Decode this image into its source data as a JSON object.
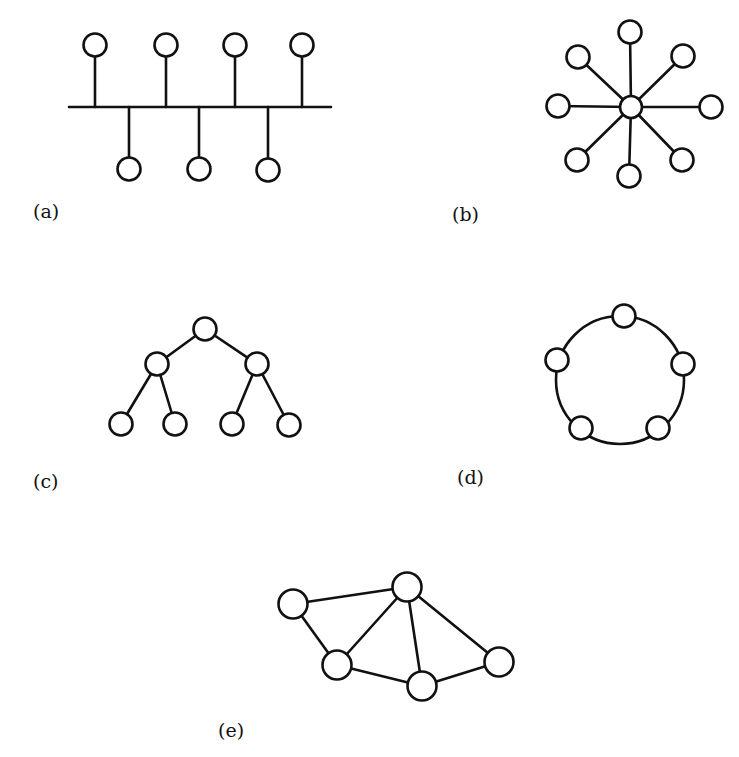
{
  "figure": {
    "panels": [
      {
        "id": "a",
        "label": "(a)",
        "topology": "bus",
        "label_pos": [
          33,
          218
        ],
        "bus": {
          "x1": 69,
          "x2": 331,
          "y": 107
        },
        "node_radius": 11.5,
        "nodes": [
          {
            "x": 95,
            "y": 45,
            "side": "top"
          },
          {
            "x": 166,
            "y": 45,
            "side": "top"
          },
          {
            "x": 235,
            "y": 45,
            "side": "top"
          },
          {
            "x": 302,
            "y": 45,
            "side": "top"
          },
          {
            "x": 129,
            "y": 169,
            "side": "bottom"
          },
          {
            "x": 199,
            "y": 169,
            "side": "bottom"
          },
          {
            "x": 268,
            "y": 170,
            "side": "bottom"
          }
        ]
      },
      {
        "id": "b",
        "label": "(b)",
        "topology": "star",
        "label_pos": [
          452,
          221
        ],
        "hub": {
          "x": 631,
          "y": 107,
          "r": 11
        },
        "node_radius": 11.5,
        "nodes": [
          {
            "x": 630,
            "y": 32
          },
          {
            "x": 683,
            "y": 56
          },
          {
            "x": 711,
            "y": 107
          },
          {
            "x": 682,
            "y": 160
          },
          {
            "x": 629,
            "y": 176
          },
          {
            "x": 577,
            "y": 160
          },
          {
            "x": 558,
            "y": 106
          },
          {
            "x": 578,
            "y": 57
          }
        ]
      },
      {
        "id": "c",
        "label": "(c)",
        "topology": "tree",
        "label_pos": [
          33,
          488
        ],
        "node_radius": 11.5,
        "nodes": [
          {
            "x": 205,
            "y": 329
          },
          {
            "x": 157,
            "y": 364
          },
          {
            "x": 257,
            "y": 364
          },
          {
            "x": 121,
            "y": 424
          },
          {
            "x": 175,
            "y": 424
          },
          {
            "x": 232,
            "y": 424
          },
          {
            "x": 289,
            "y": 425
          }
        ],
        "edges": [
          [
            0,
            1
          ],
          [
            0,
            2
          ],
          [
            1,
            3
          ],
          [
            1,
            4
          ],
          [
            2,
            5
          ],
          [
            2,
            6
          ]
        ]
      },
      {
        "id": "d",
        "label": "(d)",
        "topology": "ring",
        "label_pos": [
          457,
          484
        ],
        "ring": {
          "cx": 620,
          "cy": 380,
          "r": 64
        },
        "node_radius": 11.5,
        "nodes": [
          {
            "x": 624,
            "y": 316
          },
          {
            "x": 683,
            "y": 364
          },
          {
            "x": 658,
            "y": 428
          },
          {
            "x": 581,
            "y": 428
          },
          {
            "x": 557,
            "y": 360
          }
        ]
      },
      {
        "id": "e",
        "label": "(e)",
        "topology": "mesh",
        "label_pos": [
          218,
          737
        ],
        "node_radius": 14.5,
        "nodes": [
          {
            "x": 293,
            "y": 604
          },
          {
            "x": 407,
            "y": 587
          },
          {
            "x": 337,
            "y": 665
          },
          {
            "x": 422,
            "y": 686
          },
          {
            "x": 499,
            "y": 662
          }
        ],
        "edges": [
          [
            0,
            1
          ],
          [
            0,
            2
          ],
          [
            1,
            2
          ],
          [
            1,
            3
          ],
          [
            1,
            4
          ],
          [
            2,
            3
          ],
          [
            3,
            4
          ]
        ]
      }
    ]
  }
}
